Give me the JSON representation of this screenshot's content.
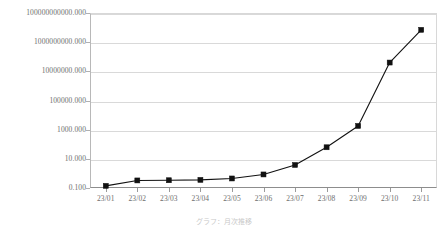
{
  "chart_data": {
    "type": "line",
    "title": "",
    "xlabel": "",
    "ylabel": "",
    "yscale": "log",
    "ylim": [
      0.1,
      100000000000
    ],
    "grid": true,
    "legend": "none",
    "categories": [
      "23/01",
      "23/02",
      "23/03",
      "23/04",
      "23/05",
      "23/06",
      "23/07",
      "23/08",
      "23/09",
      "23/10",
      "23/11"
    ],
    "series": [
      {
        "name": "series-1",
        "marker": "square",
        "color": "#111111",
        "values": [
          0.14,
          0.33,
          0.34,
          0.36,
          0.45,
          0.85,
          3.8,
          62,
          1800,
          40000000,
          7000000000
        ]
      }
    ],
    "ytick_labels": [
      "100000000000.000",
      "1000000000.000",
      "10000000.000",
      "100000.000",
      "1000.000",
      "10.000",
      "0.100"
    ],
    "ytick_values": [
      100000000000,
      1000000000,
      10000000,
      100000,
      1000,
      10,
      0.1
    ]
  },
  "caption": {
    "text": "グラフ：月次推移"
  },
  "colors": {
    "series": "#111111",
    "grid": "#d9d9d9",
    "axis": "#8d8d8d",
    "tick_text": "#6e6e6e",
    "background": "#ffffff"
  }
}
